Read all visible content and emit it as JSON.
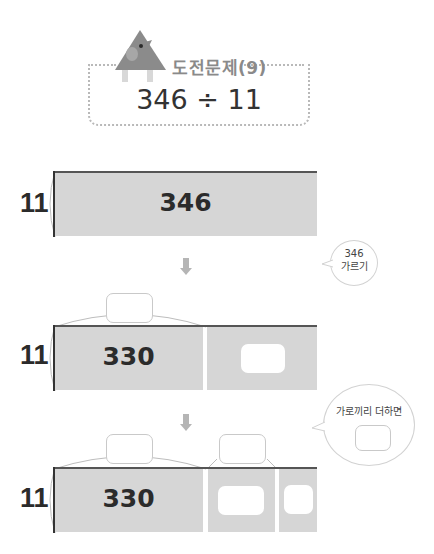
{
  "header": {
    "title": "도전문제(9)",
    "expression": "346 ÷ 11",
    "mascot_icon": "triangle-house-mascot"
  },
  "colors": {
    "bar_fill": "#d6d6d6",
    "bar_edge": "#555555",
    "dotted_border": "#b9b9b9",
    "title_text": "#8a8a8a",
    "arrow": "#b5b5b5"
  },
  "steps": [
    {
      "side_label": "11",
      "segments": [
        {
          "value": "346"
        }
      ]
    },
    {
      "side_label": "11",
      "segments": [
        {
          "value": "330"
        },
        {
          "value": ""
        }
      ],
      "top_blanks": 1
    },
    {
      "side_label": "11",
      "segments": [
        {
          "value": "330"
        },
        {
          "value": ""
        },
        {
          "value": ""
        }
      ],
      "top_blanks": 2
    }
  ],
  "bubbles": [
    {
      "line1": "346",
      "line2": "가르기"
    },
    {
      "text": "가로끼리 더하면"
    }
  ],
  "arrows": [
    "down-arrow",
    "down-arrow"
  ]
}
